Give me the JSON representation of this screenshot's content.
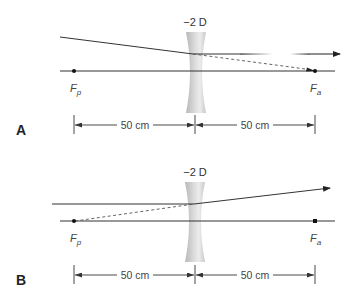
{
  "figure": {
    "colors": {
      "ray": "#333333",
      "axis": "#333333",
      "lens_edge": "#bdbdbd",
      "lens_center": "#e8e8e8",
      "text": "#333333"
    },
    "panels": [
      {
        "id": "A",
        "label": "A",
        "lens_power": "−2 D",
        "focal_left": {
          "main": "F",
          "sub": "p"
        },
        "focal_right": {
          "main": "F",
          "sub": "a"
        },
        "dim_left": "50 cm",
        "dim_right": "50 cm",
        "description": "Oblique ray converging toward Fa exits parallel to axis"
      },
      {
        "id": "B",
        "label": "B",
        "lens_power": "−2 D",
        "focal_left": {
          "main": "F",
          "sub": "p"
        },
        "focal_right": {
          "main": "F",
          "sub": "a"
        },
        "dim_left": "50 cm",
        "dim_right": "50 cm",
        "description": "Parallel ray diverges as if coming from Fp"
      }
    ]
  }
}
